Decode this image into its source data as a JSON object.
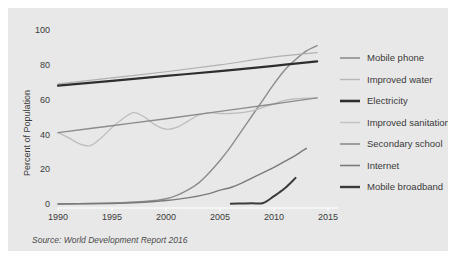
{
  "figure": {
    "background_color": "#e8e8e8",
    "page_background": "#ffffff",
    "source_note": "Source: World Development Report 2016"
  },
  "chart_data": {
    "type": "line",
    "title": "",
    "xlabel": "",
    "ylabel": "Percent of Population",
    "xlim": [
      1990,
      2015
    ],
    "ylim": [
      0,
      100
    ],
    "grid": false,
    "legend_position": "right",
    "xticks": [
      1990,
      1995,
      2000,
      2005,
      2010,
      2015
    ],
    "xtick_labels": [
      "1990",
      "1995",
      "2000",
      "2005",
      "2010",
      "2015"
    ],
    "yticks": [
      0,
      20,
      40,
      60,
      80,
      100
    ],
    "ytick_labels": [
      "0",
      "20",
      "40",
      "60",
      "80",
      "100"
    ],
    "series": [
      {
        "name": "Mobile phone",
        "color": "#8c8c8c",
        "width": 1.4,
        "x": [
          1990,
          1992,
          1994,
          1996,
          1998,
          1999,
          2000,
          2001,
          2002,
          2003,
          2004,
          2005,
          2006,
          2007,
          2008,
          2009,
          2010,
          2011,
          2012,
          2013,
          2014
        ],
        "values": [
          0,
          0.2,
          0.4,
          0.8,
          1.4,
          2.0,
          3.0,
          5.0,
          8.0,
          12.0,
          18.0,
          25.0,
          33.0,
          42.0,
          51.0,
          60.0,
          69.0,
          77.0,
          83.0,
          88.0,
          91.0
        ]
      },
      {
        "name": "Improved water",
        "color": "#b0b0b0",
        "width": 1.2,
        "x": [
          1990,
          1995,
          2000,
          2005,
          2010,
          2014
        ],
        "values": [
          69.0,
          72.5,
          76.0,
          80.0,
          84.5,
          87.0
        ]
      },
      {
        "name": "Electricity",
        "color": "#2e2e2e",
        "width": 2.2,
        "x": [
          1990,
          1995,
          2000,
          2005,
          2010,
          2014
        ],
        "values": [
          68.0,
          70.8,
          73.6,
          76.4,
          79.4,
          82.0
        ]
      },
      {
        "name": "Improved sanitation",
        "color": "#bdbdbd",
        "width": 1.3,
        "x": [
          1990,
          1991,
          1992,
          1993,
          1994,
          1995,
          1996,
          1997,
          1998,
          1999,
          2000,
          2001,
          2002,
          2003,
          2004,
          2005,
          2006,
          2007,
          2008,
          2009,
          2010,
          2011,
          2012,
          2013,
          2014
        ],
        "values": [
          41.0,
          38.0,
          34.5,
          33.5,
          38.0,
          44.0,
          49.0,
          52.5,
          50.0,
          45.5,
          43.0,
          44.0,
          47.5,
          51.0,
          52.5,
          52.0,
          52.0,
          52.5,
          53.5,
          55.5,
          57.5,
          59.5,
          60.5,
          60.8,
          61.0
        ]
      },
      {
        "name": "Secondary school",
        "color": "#8c8c8c",
        "width": 1.4,
        "x": [
          1990,
          1995,
          2000,
          2005,
          2010,
          2014
        ],
        "values": [
          41.0,
          45.0,
          49.0,
          53.2,
          57.5,
          61.0
        ]
      },
      {
        "name": "Internet",
        "color": "#7a7a7a",
        "width": 1.4,
        "x": [
          1990,
          1995,
          1998,
          2000,
          2002,
          2004,
          2005,
          2006,
          2007,
          2008,
          2009,
          2010,
          2011,
          2012,
          2013
        ],
        "values": [
          0,
          0.3,
          1.0,
          2.0,
          3.5,
          6.0,
          8.0,
          9.5,
          12.0,
          15.0,
          18.0,
          21.0,
          24.5,
          28.0,
          32.0
        ]
      },
      {
        "name": "Mobile broadband",
        "color": "#3a3a3a",
        "width": 2.0,
        "x": [
          2006,
          2007,
          2008,
          2009,
          2010,
          2011,
          2012
        ],
        "values": [
          0.2,
          0.3,
          0.4,
          0.6,
          4.5,
          9.0,
          15.0
        ]
      }
    ]
  },
  "legend": {
    "items": [
      {
        "label": "Mobile phone",
        "color": "#8c8c8c",
        "width": 1.6
      },
      {
        "label": "Improved water",
        "color": "#b8b8b8",
        "width": 1.4
      },
      {
        "label": "Electricity",
        "color": "#2e2e2e",
        "width": 2.6
      },
      {
        "label": "Improved sanitation",
        "color": "#c2c2c2",
        "width": 1.4
      },
      {
        "label": "Secondary school",
        "color": "#8c8c8c",
        "width": 1.6
      },
      {
        "label": "Internet",
        "color": "#7a7a7a",
        "width": 1.6
      },
      {
        "label": "Mobile broadband",
        "color": "#3a3a3a",
        "width": 2.4
      }
    ]
  }
}
